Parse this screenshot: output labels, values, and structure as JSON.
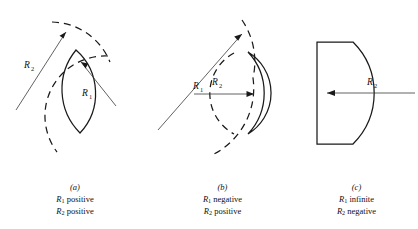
{
  "figure": {
    "type": "optics-sign-convention-diagram",
    "line_color": "#1a1a1a",
    "background_color": "#ffffff"
  },
  "panels": [
    {
      "id": "a",
      "letter": "(a)",
      "lens_shape": "biconvex",
      "labels": [
        {
          "name": "R2",
          "symbol": "R",
          "subscript": "2"
        },
        {
          "name": "R1",
          "symbol": "R",
          "subscript": "1"
        }
      ],
      "caption_lines": [
        {
          "symbol": "R",
          "subscript": "1",
          "text": " positive"
        },
        {
          "symbol": "R",
          "subscript": "2",
          "text": " positive"
        }
      ]
    },
    {
      "id": "b",
      "letter": "(b)",
      "lens_shape": "meniscus",
      "labels": [
        {
          "name": "R1",
          "symbol": "R",
          "subscript": "1"
        },
        {
          "name": "R2",
          "symbol": "R",
          "subscript": "2"
        }
      ],
      "caption_lines": [
        {
          "symbol": "R",
          "subscript": "1",
          "text": " negative"
        },
        {
          "symbol": "R",
          "subscript": "2",
          "text": " positive"
        }
      ]
    },
    {
      "id": "c",
      "letter": "(c)",
      "lens_shape": "plano-concave",
      "labels": [
        {
          "name": "R2",
          "symbol": "R",
          "subscript": "2"
        }
      ],
      "caption_lines": [
        {
          "symbol": "R",
          "subscript": "1",
          "text": " infinite"
        },
        {
          "symbol": "R",
          "subscript": "2",
          "text": " negative"
        }
      ]
    }
  ]
}
